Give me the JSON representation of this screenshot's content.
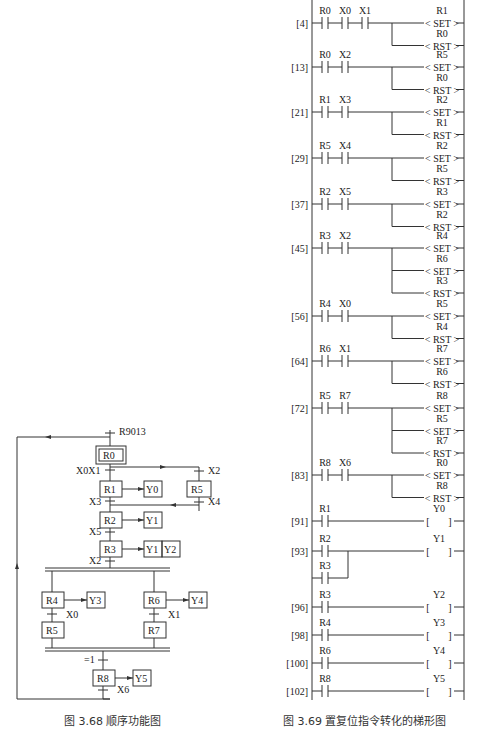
{
  "sfc": {
    "caption": "图 3.68   顺序功能图",
    "initial_condition": "R9013",
    "steps": {
      "R0": "R0",
      "R1": "R1",
      "R2": "R2",
      "R3": "R3",
      "R4": "R4",
      "R5a": "R5",
      "R5b": "R5",
      "R6": "R6",
      "R7": "R7",
      "R8": "R8"
    },
    "actions": {
      "R1": [
        "Y0"
      ],
      "R2": [
        "Y1"
      ],
      "R3": [
        "Y1",
        "Y2"
      ],
      "R4": [
        "Y3"
      ],
      "R6": [
        "Y4"
      ],
      "R8": [
        "Y5"
      ]
    },
    "transitions": {
      "R0_R1": "X0X1",
      "R0_R5": "X2",
      "R1_R2": "X3",
      "R5_R2": "X4",
      "R2_R3": "X5",
      "R3_par": "X2",
      "R4_R5": "X0",
      "R6_R7": "X1",
      "join_R8": "=1",
      "R8_R0": "X6"
    }
  },
  "ladder": {
    "caption": "图 3.69   置复位指令转化的梯形图",
    "rungs": [
      {
        "addr": "[4]",
        "contacts": [
          "R0",
          "X0",
          "X1"
        ],
        "outputs": [
          {
            "dev": "R1",
            "instr": "SET"
          },
          {
            "dev": "R0",
            "instr": "RST"
          }
        ]
      },
      {
        "addr": "[13]",
        "contacts": [
          "R0",
          "X2"
        ],
        "outputs": [
          {
            "dev": "R5",
            "instr": "SET"
          },
          {
            "dev": "R0",
            "instr": "RST"
          }
        ]
      },
      {
        "addr": "[21]",
        "contacts": [
          "R1",
          "X3"
        ],
        "outputs": [
          {
            "dev": "R2",
            "instr": "SET"
          },
          {
            "dev": "R1",
            "instr": "RST"
          }
        ]
      },
      {
        "addr": "[29]",
        "contacts": [
          "R5",
          "X4"
        ],
        "outputs": [
          {
            "dev": "R2",
            "instr": "SET"
          },
          {
            "dev": "R5",
            "instr": "RST"
          }
        ]
      },
      {
        "addr": "[37]",
        "contacts": [
          "R2",
          "X5"
        ],
        "outputs": [
          {
            "dev": "R3",
            "instr": "SET"
          },
          {
            "dev": "R2",
            "instr": "RST"
          }
        ]
      },
      {
        "addr": "[45]",
        "contacts": [
          "R3",
          "X2"
        ],
        "outputs": [
          {
            "dev": "R4",
            "instr": "SET"
          },
          {
            "dev": "R6",
            "instr": "SET"
          },
          {
            "dev": "R3",
            "instr": "RST"
          }
        ]
      },
      {
        "addr": "[56]",
        "contacts": [
          "R4",
          "X0"
        ],
        "outputs": [
          {
            "dev": "R5",
            "instr": "SET"
          },
          {
            "dev": "R4",
            "instr": "RST"
          }
        ]
      },
      {
        "addr": "[64]",
        "contacts": [
          "R6",
          "X1"
        ],
        "outputs": [
          {
            "dev": "R7",
            "instr": "SET"
          },
          {
            "dev": "R6",
            "instr": "RST"
          }
        ]
      },
      {
        "addr": "[72]",
        "contacts": [
          "R5",
          "R7"
        ],
        "outputs": [
          {
            "dev": "R8",
            "instr": "SET"
          },
          {
            "dev": "R5",
            "instr": "SET"
          },
          {
            "dev": "R7",
            "instr": "RST"
          }
        ]
      },
      {
        "addr": "[83]",
        "contacts": [
          "R8",
          "X6"
        ],
        "outputs": [
          {
            "dev": "R0",
            "instr": "SET"
          },
          {
            "dev": "R8",
            "instr": "RST"
          }
        ]
      },
      {
        "addr": "[91]",
        "contacts": [
          "R1"
        ],
        "coil": "Y0"
      },
      {
        "addr": "[93]",
        "contacts": [
          "R2"
        ],
        "parallel": "R3",
        "coil": "Y1"
      },
      {
        "addr": "[96]",
        "contacts": [
          "R3"
        ],
        "coil": "Y2"
      },
      {
        "addr": "[98]",
        "contacts": [
          "R4"
        ],
        "coil": "Y3"
      },
      {
        "addr": "[100]",
        "contacts": [
          "R6"
        ],
        "coil": "Y4"
      },
      {
        "addr": "[102]",
        "contacts": [
          "R8"
        ],
        "coil": "Y5"
      }
    ]
  }
}
